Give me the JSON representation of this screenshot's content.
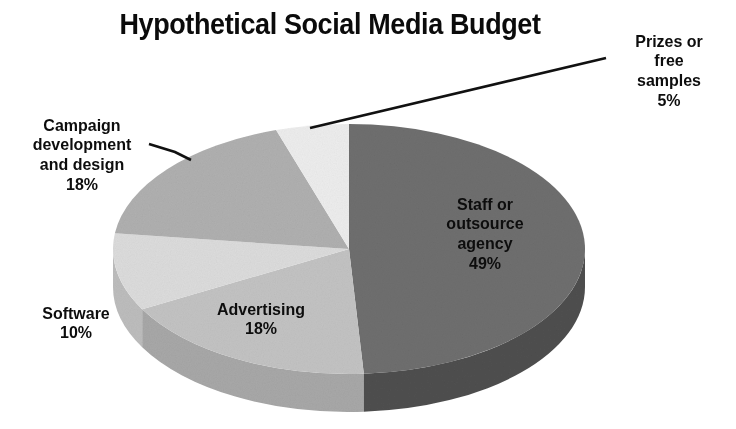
{
  "chart_data": {
    "type": "pie",
    "title": "Hypothetical Social Media Budget",
    "subtitle": "",
    "xlabel": "",
    "ylabel": "",
    "style": "3d-pie-grayscale",
    "grid": false,
    "legend_position": "none",
    "start_angle_deg": 0,
    "direction": "clockwise",
    "units": "percent",
    "categories": [
      "Staff or outsource agency",
      "Advertising",
      "Software",
      "Campaign development and design",
      "Prizes or free samples"
    ],
    "values": [
      49,
      18,
      10,
      18,
      5
    ],
    "slices": [
      {
        "name": "Staff or outsource agency",
        "label_lines": "Staff or\noutsource\nagency",
        "percent_text": "49%",
        "value": 49,
        "color": "#6f6f6f",
        "side_color": "#4f4f4f",
        "label_placement": "inside"
      },
      {
        "name": "Advertising",
        "label_lines": "Advertising",
        "percent_text": "18%",
        "value": 18,
        "color": "#c3c3c3",
        "side_color": "#a8a8a8",
        "label_placement": "inside"
      },
      {
        "name": "Software",
        "label_lines": "Software",
        "percent_text": "10%",
        "value": 10,
        "color": "#dcdcdc",
        "side_color": "#bdbdbd",
        "label_placement": "outside-left"
      },
      {
        "name": "Campaign development and design",
        "label_lines": "Campaign\ndevelopment\nand design",
        "percent_text": "18%",
        "value": 18,
        "color": "#b0b0b0",
        "side_color": "#989898",
        "label_placement": "outside-left-leader"
      },
      {
        "name": "Prizes or free samples",
        "label_lines": "Prizes or\nfree\nsamples",
        "percent_text": "5%",
        "value": 5,
        "color": "#ededed",
        "side_color": "#d2d2d2",
        "label_placement": "outside-top-right-leader"
      }
    ]
  },
  "colors": {
    "background": "#ffffff",
    "text": "#111111",
    "leader_line": "#111111",
    "staff_slice": "#6f6f6f",
    "advertising_slice": "#c3c3c3",
    "software_slice": "#dcdcdc",
    "campaign_slice": "#b0b0b0",
    "prizes_slice": "#ededed"
  }
}
